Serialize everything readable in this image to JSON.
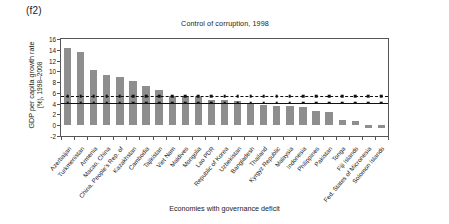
{
  "figure": {
    "panel_label": "(f2)",
    "title": "Control of corruption, 1998",
    "ylabel_line1": "GDP per capita growth rate",
    "ylabel_line2": "(%), 1998–2008",
    "xlabel": "Economies with governance deficit",
    "bar_color": "#8e8e8e",
    "axis_color": "#555555",
    "line_color": "#111111"
  },
  "chart_data": {
    "type": "bar",
    "title": "Control of corruption, 1998",
    "xlabel": "Economies with governance deficit",
    "ylabel": "GDP per capita growth rate (%), 1998–2008",
    "ylim": [
      -2,
      16
    ],
    "yticks": [
      -2,
      0,
      2,
      4,
      6,
      8,
      10,
      12,
      14,
      16
    ],
    "ytick_labels": [
      "-2",
      "0",
      "2",
      "4",
      "6",
      "8",
      "10",
      "12",
      "14",
      "16"
    ],
    "grid": false,
    "legend": null,
    "categories": [
      "Azerbaijan",
      "Turkmenistan",
      "Armenia",
      "Macao, China",
      "China, People's Rep. of",
      "Kazakhstan",
      "Cambodia",
      "Tajikistan",
      "Viet Nam",
      "Maldives",
      "Mongolia",
      "Lao PDR",
      "Republic of Korea",
      "Uzbekistan",
      "Bangladesh",
      "Thailand",
      "Kyrgyz Republic",
      "Malaysia",
      "Indonesia",
      "Philippines",
      "Pakistan",
      "Tonga",
      "Fiji Islands",
      "Fed. States of Micronesia",
      "Solomon Islands"
    ],
    "values": [
      14.3,
      13.5,
      10.3,
      9.3,
      8.9,
      8.2,
      7.3,
      6.6,
      5.5,
      5.4,
      5.3,
      4.6,
      4.6,
      4.5,
      4.1,
      3.8,
      3.6,
      3.6,
      3.4,
      2.6,
      2.5,
      0.9,
      0.8,
      -0.5,
      -0.6
    ],
    "reference_lines": [
      {
        "name": "dashed-reference-line",
        "value": 5.4,
        "style": "dashed",
        "marker": "square"
      },
      {
        "name": "solid-reference-line",
        "value": 4.2,
        "style": "solid",
        "marker": "square"
      }
    ]
  }
}
